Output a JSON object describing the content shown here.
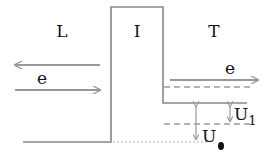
{
  "regions": {
    "left": "L",
    "insulator": "I",
    "right": "T"
  },
  "electrons": {
    "left": "e",
    "right": "e"
  },
  "potentials": {
    "u1_main": "U",
    "u1_sub": "1",
    "u0_main": "U",
    "u0_sub": "●"
  },
  "colors": {
    "line": "#888888",
    "arrow": "#9a9a9a",
    "text": "#111111"
  }
}
